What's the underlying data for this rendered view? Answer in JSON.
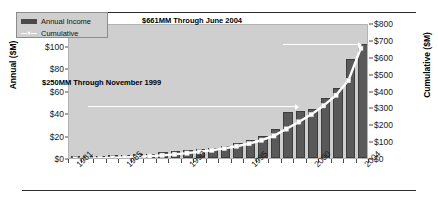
{
  "chart_data": {
    "type": "bar",
    "title": "",
    "subtitle": "",
    "xlabel": "",
    "ylabel": "Annual ($M)",
    "y2label": "Cumulative ($M)",
    "grid": false,
    "legend_position": "top-left",
    "x": [
      1981,
      1982,
      1983,
      1984,
      1985,
      1986,
      1987,
      1988,
      1989,
      1990,
      1991,
      1992,
      1993,
      1994,
      1995,
      1996,
      1997,
      1998,
      1999,
      2000,
      2001,
      2002,
      2003,
      2004
    ],
    "categories": [
      "1981",
      "1982",
      "1983",
      "1984",
      "1985",
      "1986",
      "1987",
      "1988",
      "1989",
      "1990",
      "1991",
      "1992",
      "1993",
      "1994",
      "1995",
      "1996",
      "1997",
      "1998",
      "1999",
      "2000",
      "2001",
      "2002",
      "2003",
      "2004"
    ],
    "xtick_labels": [
      "1981",
      "1985",
      "1990",
      "1995",
      "2000",
      "2004"
    ],
    "xtick_values": [
      1981,
      1985,
      1990,
      1995,
      2000,
      2004
    ],
    "ylim": [
      0,
      120
    ],
    "yticks": [
      "$0",
      "$20",
      "$40",
      "$60",
      "$80",
      "$100",
      "$120"
    ],
    "ytick_values": [
      0,
      20,
      40,
      60,
      80,
      100,
      120
    ],
    "y2lim": [
      0,
      800
    ],
    "y2ticks": [
      "$0",
      "$100",
      "$200",
      "$300",
      "$400",
      "$500",
      "$600",
      "$700",
      "$800"
    ],
    "y2tick_values": [
      0,
      100,
      200,
      300,
      400,
      500,
      600,
      700,
      800
    ],
    "series": [
      {
        "name": "Annual Income",
        "type": "bar",
        "axis": "left",
        "color": "#595959",
        "values": [
          1,
          1.5,
          2,
          2.5,
          3,
          3.5,
          4,
          5,
          6,
          7,
          8,
          9,
          11,
          13,
          16,
          20,
          26,
          41,
          42,
          44,
          53,
          62,
          88,
          101
        ]
      },
      {
        "name": "Cumulative",
        "type": "line",
        "axis": "right",
        "color": "#ffffff",
        "values": [
          1,
          2.5,
          4.5,
          7,
          10,
          13.5,
          17.5,
          22.5,
          28.5,
          35.5,
          43.5,
          52.5,
          63.5,
          76.5,
          92.5,
          112.5,
          138.5,
          179.5,
          221.5,
          265.5,
          318.5,
          380.5,
          468.5,
          661
        ]
      }
    ],
    "annotations": [
      {
        "text": "$661MM Through June 2004",
        "value": 661,
        "year": 2004
      },
      {
        "text": "$250MM Through November 1999",
        "value": 250,
        "year": 1999
      }
    ]
  },
  "legend": {
    "items": [
      {
        "label": "Annual Income",
        "marker": "bar-swatch"
      },
      {
        "label": "Cumulative",
        "marker": "line-swatch"
      }
    ]
  }
}
